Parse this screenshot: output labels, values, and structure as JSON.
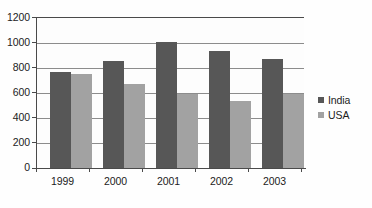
{
  "chart_data": {
    "type": "bar",
    "title": "",
    "subtitle": "",
    "xlabel": "",
    "ylabel": "",
    "categories": [
      "1999",
      "2000",
      "2001",
      "2002",
      "2003"
    ],
    "series": [
      {
        "name": "India",
        "color": "#575757",
        "values": [
          760,
          850,
          1000,
          930,
          865
        ]
      },
      {
        "name": "USA",
        "color": "#a2a2a2",
        "values": [
          750,
          670,
          590,
          530,
          585
        ]
      }
    ],
    "ylim": [
      0,
      1200
    ],
    "yticks": [
      0,
      200,
      400,
      600,
      800,
      1000,
      1200
    ],
    "ytick_labels": [
      "0",
      "200",
      "400",
      "600",
      "800",
      "1000",
      "1200"
    ],
    "grid": true,
    "grid_axis": "y",
    "legend_position": "right",
    "legend_entries": [
      "India",
      "USA"
    ],
    "annotations": []
  },
  "colors": {
    "india": "#575757",
    "usa": "#a2a2a2",
    "axis": "#4a4a4a",
    "grid": "#8c8c8c",
    "background": "#fefefe",
    "text": "#1c1c1c"
  }
}
